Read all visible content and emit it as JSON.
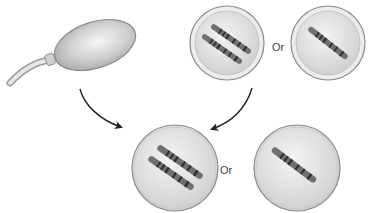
{
  "diagram": {
    "labels": {
      "top_or": "Or",
      "bottom_or": "Or"
    },
    "elements": {
      "sperm": "sperm-cell",
      "egg_top_left": "egg-with-two-chromosomes",
      "egg_top_right": "egg-with-one-chromosome",
      "result_bottom_left": "cell-with-two-chromosomes",
      "result_bottom_right": "cell-with-one-chromosome"
    },
    "colors": {
      "cell_fill": "#dcdcdc",
      "cell_outline": "#8a8a8a",
      "chromosome": "#6e6e6e",
      "chromosome_band": "#2e2e2e",
      "arrow": "#222222",
      "text": "#444444"
    }
  }
}
